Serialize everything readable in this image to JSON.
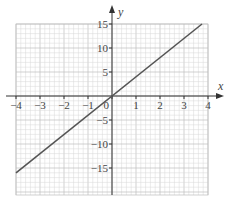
{
  "chart_data": {
    "type": "line",
    "title": "",
    "xlabel": "x",
    "ylabel": "y",
    "xlim": [
      -4,
      4
    ],
    "ylim": [
      -20,
      15
    ],
    "grid": true,
    "x_ticks": [
      -4,
      -3,
      -2,
      -1,
      0,
      1,
      2,
      3,
      4
    ],
    "x_tick_labels": [
      "−4",
      "−3",
      "−2",
      "−1",
      "0",
      "1",
      "2",
      "3",
      "4"
    ],
    "y_ticks": [
      15,
      10,
      5,
      -5,
      -10,
      -15
    ],
    "y_tick_labels": [
      "15",
      "10",
      "5",
      "−5",
      "−10",
      "−15"
    ],
    "series": [
      {
        "name": "y = 4x",
        "x": [
          -4,
          3.75
        ],
        "y": [
          -16,
          15
        ]
      }
    ]
  }
}
